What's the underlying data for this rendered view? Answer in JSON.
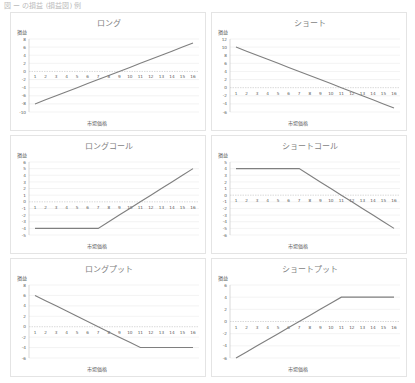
{
  "caption": "図 ー の損益 (損益図) 例",
  "axis_labels": {
    "y": "損益",
    "x": "市場価格"
  },
  "colors": {
    "line": "#7f7f7f",
    "grid": "#e6e6e6",
    "axis": "#bfbfbf",
    "text": "#595959",
    "title": "#7f7f7f",
    "zero": "#d0d0d0"
  },
  "chart_data": [
    {
      "type": "line",
      "title": "ロング",
      "xlabel": "市場価格",
      "ylabel": "損益",
      "categories": [
        1,
        2,
        3,
        4,
        5,
        6,
        7,
        8,
        9,
        10,
        11,
        12,
        13,
        14,
        15,
        16
      ],
      "values": [
        -8,
        -7,
        -6,
        -5,
        -4,
        -3,
        -2,
        -1,
        0,
        1,
        2,
        3,
        4,
        5,
        6,
        7
      ],
      "yticks": [
        8,
        6,
        4,
        2,
        0,
        -2,
        -4,
        -6,
        -8,
        -10
      ],
      "ylim": [
        -10,
        8
      ],
      "grid": true
    },
    {
      "type": "line",
      "title": "ショート",
      "xlabel": "市場価格",
      "ylabel": "損益",
      "categories": [
        1,
        2,
        3,
        4,
        5,
        6,
        7,
        8,
        9,
        10,
        11,
        12,
        13,
        14,
        15,
        16
      ],
      "values": [
        10,
        9,
        8,
        7,
        6,
        5,
        4,
        3,
        2,
        1,
        0,
        -1,
        -2,
        -3,
        -4,
        -5
      ],
      "yticks": [
        12,
        10,
        8,
        6,
        4,
        2,
        0,
        -2,
        -4,
        -6
      ],
      "ylim": [
        -6,
        12
      ],
      "grid": true
    },
    {
      "type": "line",
      "title": "ロングコール",
      "xlabel": "市場価格",
      "ylabel": "損益",
      "categories": [
        1,
        2,
        3,
        4,
        5,
        6,
        7,
        8,
        9,
        10,
        11,
        12,
        13,
        14,
        15,
        16
      ],
      "values": [
        -4,
        -4,
        -4,
        -4,
        -4,
        -4,
        -4,
        -3,
        -2,
        -1,
        0,
        1,
        2,
        3,
        4,
        5
      ],
      "yticks": [
        6,
        5,
        4,
        3,
        2,
        1,
        0,
        -1,
        -2,
        -3,
        -4,
        -5
      ],
      "ylim": [
        -5,
        6
      ],
      "grid": true
    },
    {
      "type": "line",
      "title": "ショートコール",
      "xlabel": "市場価格",
      "ylabel": "損益",
      "categories": [
        1,
        2,
        3,
        4,
        5,
        6,
        7,
        8,
        9,
        10,
        11,
        12,
        13,
        14,
        15,
        16
      ],
      "values": [
        4,
        4,
        4,
        4,
        4,
        4,
        4,
        3,
        2,
        1,
        0,
        -1,
        -2,
        -3,
        -4,
        -5
      ],
      "yticks": [
        5,
        4,
        3,
        2,
        1,
        0,
        -1,
        -2,
        -3,
        -4,
        -5,
        -6
      ],
      "ylim": [
        -6,
        5
      ],
      "grid": true
    },
    {
      "type": "line",
      "title": "ロングプット",
      "xlabel": "市場価格",
      "ylabel": "損益",
      "categories": [
        1,
        2,
        3,
        4,
        5,
        6,
        7,
        8,
        9,
        10,
        11,
        12,
        13,
        14,
        15,
        16
      ],
      "values": [
        6,
        5,
        4,
        3,
        2,
        1,
        0,
        -1,
        -2,
        -3,
        -4,
        -4,
        -4,
        -4,
        -4,
        -4
      ],
      "yticks": [
        8,
        6,
        4,
        2,
        0,
        -2,
        -4,
        -6
      ],
      "ylim": [
        -6,
        8
      ],
      "grid": true
    },
    {
      "type": "line",
      "title": "ショートプット",
      "xlabel": "市場価格",
      "ylabel": "損益",
      "categories": [
        1,
        2,
        3,
        4,
        5,
        6,
        7,
        8,
        9,
        10,
        11,
        12,
        13,
        14,
        15,
        16
      ],
      "values": [
        -6,
        -5,
        -4,
        -3,
        -2,
        -1,
        0,
        1,
        2,
        3,
        4,
        4,
        4,
        4,
        4,
        4
      ],
      "yticks": [
        6,
        4,
        2,
        0,
        -2,
        -4,
        -6
      ],
      "ylim": [
        -6,
        6
      ],
      "grid": true
    }
  ]
}
